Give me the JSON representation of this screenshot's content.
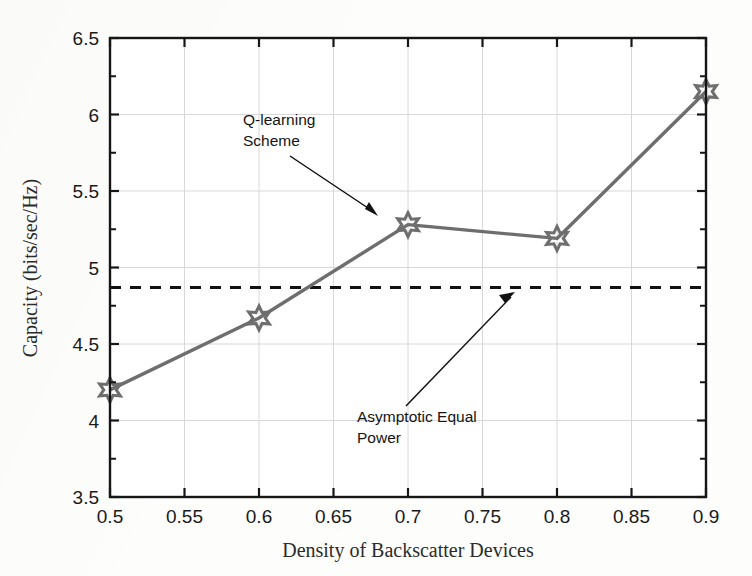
{
  "chart_data": {
    "type": "line",
    "title": "",
    "xlabel": "Density of Backscatter Devices",
    "ylabel": "Capacity (bits/sec/Hz)",
    "xlim": [
      0.5,
      0.9
    ],
    "ylim": [
      3.5,
      6.5
    ],
    "grid": true,
    "legend_position": "none",
    "xticks": [
      0.5,
      0.55,
      0.6,
      0.65,
      0.7,
      0.75,
      0.8,
      0.85,
      0.9
    ],
    "xtick_labels": [
      "0.5",
      "0.55",
      "0.6",
      "0.65",
      "0.7",
      "0.75",
      "0.8",
      "0.85",
      "0.9"
    ],
    "yticks": [
      3.5,
      4,
      4.5,
      5,
      5.5,
      6,
      6.5
    ],
    "ytick_labels": [
      "3.5",
      "4",
      "4.5",
      "5",
      "5.5",
      "6",
      "6.5"
    ],
    "x": [
      0.5,
      0.6,
      0.7,
      0.8,
      0.9
    ],
    "series": [
      {
        "name": "Q-learning Scheme",
        "style": "solid-with-star-markers",
        "color": "#6e6e6e",
        "marker": "hexagram",
        "values": [
          4.2,
          4.67,
          5.28,
          5.19,
          6.15
        ]
      },
      {
        "name": "Asymptotic Equal Power",
        "style": "dashed-horizontal",
        "color": "#111111",
        "marker": "none",
        "constant_value": 4.87
      }
    ],
    "annotations": [
      {
        "name": "q-learning-annotation",
        "text_lines": [
          "Q-learning",
          "Scheme"
        ],
        "points_to_series": "Q-learning Scheme"
      },
      {
        "name": "asymptotic-annotation",
        "text_lines": [
          "Asymptotic Equal",
          "Power"
        ],
        "points_to_series": "Asymptotic Equal Power"
      }
    ]
  },
  "colors": {
    "series_line": "#6e6e6e",
    "baseline_dashed": "#111111",
    "axis": "#161616",
    "grid": "#d8d8d8",
    "text": "#1a1a1a",
    "page_background": "#fdfdfc"
  }
}
